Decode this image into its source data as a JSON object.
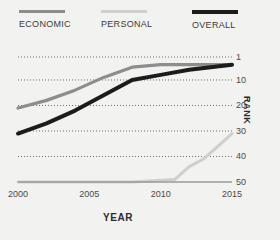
{
  "legend": {
    "items": [
      {
        "label": "ECONOMIC",
        "color": "#8d8d8d",
        "name": "legend-item-economic"
      },
      {
        "label": "PERSONAL",
        "color": "#cfcfcf",
        "name": "legend-item-personal"
      },
      {
        "label": "OVERALL",
        "color": "#1c1c1c",
        "name": "legend-item-overall"
      }
    ]
  },
  "axes": {
    "x_title": "YEAR",
    "y_title": "RANK",
    "x_ticks": [
      "2000",
      "2005",
      "2010",
      "2015"
    ],
    "y_ticks": [
      "1",
      "10",
      "20",
      "30",
      "40",
      "50"
    ]
  },
  "chart_data": {
    "type": "line",
    "title": "",
    "subtitle": "",
    "xlabel": "YEAR",
    "ylabel": "RANK",
    "xlim": [
      2000,
      2015
    ],
    "ylim": [
      1,
      50
    ],
    "y_inverted": true,
    "grid": "horizontal-dotted",
    "legend_position": "top",
    "x_ticks": [
      2000,
      2005,
      2010,
      2015
    ],
    "y_ticks": [
      1,
      10,
      20,
      30,
      40,
      50
    ],
    "series": [
      {
        "name": "ECONOMIC",
        "color": "#8d8d8d",
        "x": [
          2000,
          2002,
          2004,
          2006,
          2008,
          2010,
          2012,
          2015
        ],
        "values": [
          21,
          18,
          14,
          9,
          5,
          4,
          4,
          4
        ]
      },
      {
        "name": "PERSONAL",
        "color": "#cfcfcf",
        "x": [
          2000,
          2004,
          2008,
          2011,
          2012,
          2013,
          2015
        ],
        "values": [
          50,
          50,
          50,
          49,
          44,
          41,
          31
        ]
      },
      {
        "name": "OVERALL",
        "color": "#1c1c1c",
        "x": [
          2000,
          2002,
          2004,
          2006,
          2008,
          2010,
          2012,
          2015
        ],
        "values": [
          31,
          27,
          22,
          16,
          10,
          8,
          6,
          4
        ]
      }
    ]
  }
}
